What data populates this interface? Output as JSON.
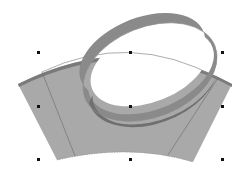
{
  "canvas": {
    "width": 252,
    "height": 175,
    "background": "#ffffff"
  },
  "shapes": {
    "band": {
      "fill": "#a9a9a9",
      "top_edge_dark": "#7a7a7a",
      "stroke": "#6e6e6e",
      "guide_line_color": "#6a6a6a"
    },
    "ring": {
      "outer_color": "#8a8a8a",
      "inner_color": "#6f6f6f",
      "outline_color": "#8c8c8c",
      "rotation_deg": -22
    },
    "arc_path_color": "#8a8a8a"
  },
  "selection": {
    "handle_color": "#111111",
    "handles": [
      {
        "name": "top-left",
        "x": 38,
        "y": 52
      },
      {
        "name": "top-center",
        "x": 130,
        "y": 52
      },
      {
        "name": "top-right",
        "x": 222,
        "y": 52
      },
      {
        "name": "middle-left",
        "x": 38,
        "y": 106
      },
      {
        "name": "center",
        "x": 130,
        "y": 106
      },
      {
        "name": "middle-right",
        "x": 222,
        "y": 106
      },
      {
        "name": "bottom-left",
        "x": 38,
        "y": 159
      },
      {
        "name": "bottom-center",
        "x": 130,
        "y": 159
      },
      {
        "name": "bottom-right",
        "x": 222,
        "y": 159
      }
    ]
  }
}
